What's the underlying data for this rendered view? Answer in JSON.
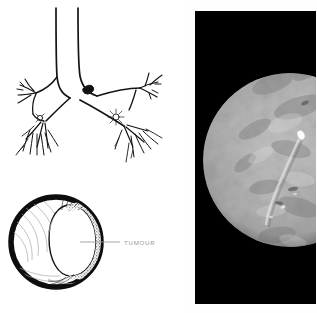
{
  "figure": {
    "background_color": "#ffffff"
  },
  "panels": [
    {
      "name": "bronchial-tree",
      "caption": "",
      "description": "Line drawing of trachea bifurcating into left and right main bronchi with distal branching; a solid dark tumour mass sits at the origin of the left main bronchus and a small stippled nodule marks the right lower lobe bronchus."
    },
    {
      "name": "airway-cross-section",
      "caption": "",
      "description": "Thick-walled circular cross-section of a bronchus; a rounded stippled tumour mass occupies the right portion of the lumen."
    },
    {
      "name": "bronchoscopy-photo",
      "caption": "",
      "description": "Grayscale bronchoscopic photograph shown as a circular field of view on a black background."
    }
  ],
  "annotations": {
    "tumour_label": "TUMOUR",
    "tumour_label_color": "#9a9a9a"
  },
  "colors": {
    "ink": "#111111",
    "paper": "#ffffff",
    "photo_backdrop": "#000000",
    "tissue_mid": "#9c9c9c",
    "tissue_light": "#cdcdcd",
    "tissue_dark": "#6e6e6e",
    "label_gray": "#9a9a9a"
  },
  "geometry": {
    "canvas": {
      "width": 317,
      "height": 313
    },
    "endoscopy_panel": {
      "x": 195,
      "y": 11,
      "width": 121,
      "height": 293
    },
    "endoscopy_circle": {
      "cx": 95,
      "cy": 149,
      "r": 87
    }
  }
}
